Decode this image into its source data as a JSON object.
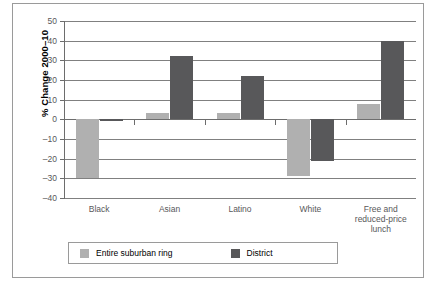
{
  "chart_data": {
    "type": "bar",
    "title": "",
    "xlabel": "",
    "ylabel": "% Change 2000–10",
    "ylim": [
      -40,
      50
    ],
    "ytick_step": 10,
    "yticks": [
      50,
      40,
      30,
      20,
      10,
      0,
      -10,
      -20,
      -30,
      -40
    ],
    "ytick_labels": [
      "50",
      "40",
      "30",
      "20",
      "10",
      "0",
      "–10",
      "–20",
      "–30",
      "–40"
    ],
    "grid": true,
    "grid_axis": "y",
    "legend_position": "bottom",
    "categories": [
      "Black",
      "Asian",
      "Latino",
      "White",
      "Free and\nreduced-price\nlunch"
    ],
    "category_lines": [
      [
        "Black"
      ],
      [
        "Asian"
      ],
      [
        "Latino"
      ],
      [
        "White"
      ],
      [
        "Free and",
        "reduced-price",
        "lunch"
      ]
    ],
    "series": [
      {
        "name": "Entire suburban ring",
        "color": "#b0b0b0",
        "values": [
          -30,
          3,
          3,
          -29,
          8
        ]
      },
      {
        "name": "District",
        "color": "#58585a",
        "values": [
          -1,
          32,
          22,
          -21,
          40
        ]
      }
    ]
  },
  "colors": {
    "series_suburban": "#b0b0b0",
    "series_district": "#58585a",
    "gridline": "#808080",
    "axis": "#6d6d6d",
    "frame_border": "#9a9a9a",
    "text": "#58585a",
    "background": "#ffffff"
  }
}
